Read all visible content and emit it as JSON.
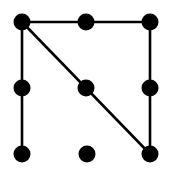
{
  "diagram": {
    "type": "dot-grid-pattern",
    "grid": {
      "rows": 3,
      "cols": 3
    },
    "colors": {
      "background": "#ffffff",
      "dot": "#000000",
      "line": "#000000"
    },
    "dot_radius": 8.5,
    "line_width": 2.6,
    "nodes": [
      {
        "id": 0,
        "row": 0,
        "col": 0,
        "x": 22,
        "y": 22
      },
      {
        "id": 1,
        "row": 0,
        "col": 1,
        "x": 86,
        "y": 22
      },
      {
        "id": 2,
        "row": 0,
        "col": 2,
        "x": 150,
        "y": 22
      },
      {
        "id": 3,
        "row": 1,
        "col": 0,
        "x": 22,
        "y": 88
      },
      {
        "id": 4,
        "row": 1,
        "col": 1,
        "x": 86,
        "y": 88
      },
      {
        "id": 5,
        "row": 1,
        "col": 2,
        "x": 150,
        "y": 88
      },
      {
        "id": 6,
        "row": 2,
        "col": 0,
        "x": 22,
        "y": 154
      },
      {
        "id": 7,
        "row": 2,
        "col": 1,
        "x": 87,
        "y": 154
      },
      {
        "id": 8,
        "row": 2,
        "col": 2,
        "x": 150,
        "y": 154
      }
    ],
    "edges": [
      [
        0,
        1
      ],
      [
        1,
        2
      ],
      [
        0,
        3
      ],
      [
        3,
        6
      ],
      [
        2,
        5
      ],
      [
        5,
        8
      ],
      [
        0,
        4
      ],
      [
        4,
        8
      ]
    ]
  }
}
